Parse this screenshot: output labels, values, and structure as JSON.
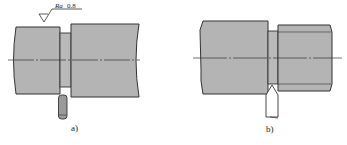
{
  "figures": [
    {
      "id": "a",
      "caption": "a)",
      "surface_finish": {
        "symbol": "Ra",
        "value": "0.8"
      },
      "tool": "rounded-tool"
    },
    {
      "id": "b",
      "caption": "b)",
      "tool": "pointed-tool"
    }
  ],
  "colors": {
    "part_fill": "#b4b4b4",
    "outline": "#333333",
    "background": "#ffffff"
  }
}
